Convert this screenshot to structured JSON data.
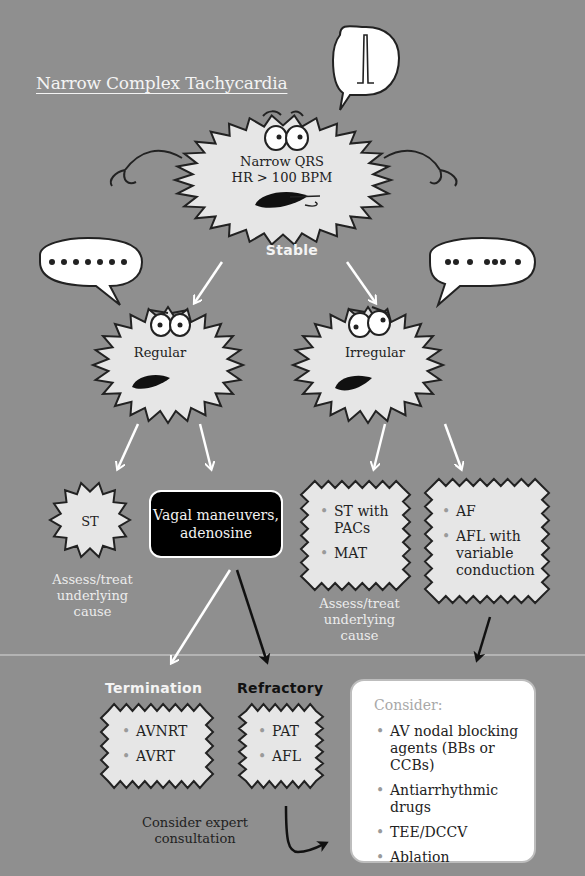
{
  "title": "Narrow Complex Tachycardia",
  "root": {
    "line1": "Narrow QRS",
    "line2": "HR > 100 BPM",
    "speech": "narrow-qrs-complex-icon"
  },
  "branch_label": "Stable",
  "regular": {
    "label": "Regular",
    "speech": "regular-dots-icon"
  },
  "irregular": {
    "label": "Irregular",
    "speech": "irregular-dots-icon"
  },
  "st": {
    "label": "ST",
    "note": [
      "Assess/treat",
      "underlying",
      "cause"
    ]
  },
  "vagal": {
    "line1": "Vagal maneuvers,",
    "line2": "adenosine"
  },
  "irregular_left": {
    "items": [
      "ST with PACs",
      "MAT"
    ],
    "note": [
      "Assess/treat",
      "underlying",
      "cause"
    ]
  },
  "irregular_right": {
    "items": [
      "AF",
      "AFL with variable conduction"
    ]
  },
  "termination": {
    "label": "Termination",
    "items": [
      "AVNRT",
      "AVRT"
    ]
  },
  "refractory": {
    "label": "Refractory",
    "items": [
      "PAT",
      "AFL"
    ],
    "note": [
      "Consider expert",
      "consultation"
    ]
  },
  "consider": {
    "heading": "Consider:",
    "items": [
      "AV nodal blocking agents (BBs or CCBs)",
      "Antiarrhythmic drugs",
      "TEE/DCCV",
      "Ablation"
    ]
  },
  "colors": {
    "background": "#8f8f8f",
    "burst_fill": "#e6e6e6",
    "arrow_white": "#ffffff",
    "arrow_black": "#111111"
  }
}
